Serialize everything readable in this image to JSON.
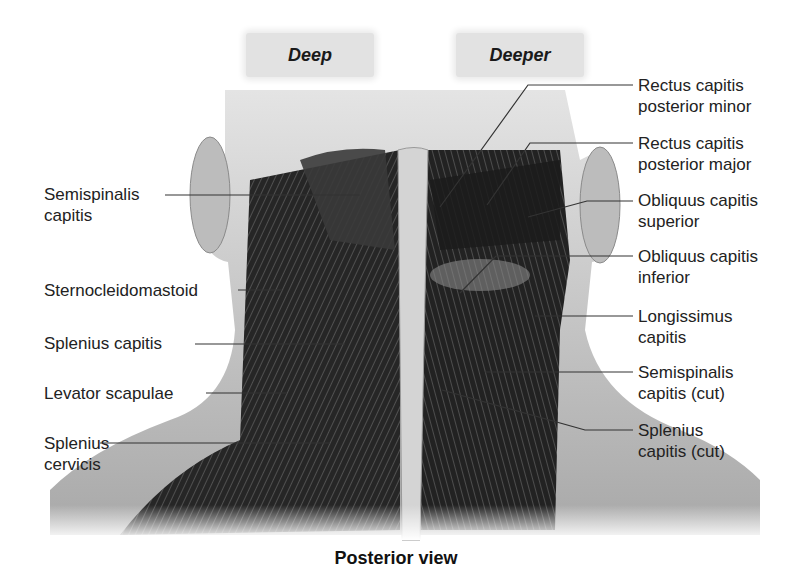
{
  "figure": {
    "view_tags": [
      {
        "label": "Deep"
      },
      {
        "label": "Deeper"
      }
    ],
    "left_labels": [
      {
        "lines": [
          "Semispinalis",
          "capitis"
        ]
      },
      {
        "lines": [
          "Sternocleidomastoid"
        ]
      },
      {
        "lines": [
          "Splenius capitis"
        ]
      },
      {
        "lines": [
          "Levator scapulae"
        ]
      },
      {
        "lines": [
          "Splenius",
          "cervicis"
        ]
      }
    ],
    "right_labels": [
      {
        "lines": [
          "Rectus capitis",
          "posterior minor"
        ]
      },
      {
        "lines": [
          "Rectus capitis",
          "posterior major"
        ]
      },
      {
        "lines": [
          "Obliquus capitis",
          "superior"
        ]
      },
      {
        "lines": [
          "Obliquus capitis",
          "inferior"
        ]
      },
      {
        "lines": [
          "Longissimus",
          "capitis"
        ]
      },
      {
        "lines": [
          "Semispinalis",
          "capitis (cut)"
        ]
      },
      {
        "lines": [
          "Splenius",
          "capitis (cut)"
        ]
      }
    ],
    "caption": "Posterior view",
    "colors": {
      "background": "#ffffff",
      "muscle_dark": "#1c1c1c",
      "skin": "#bdbdbd",
      "bone": "#d6d6d6",
      "leader_line": "#333333"
    }
  }
}
